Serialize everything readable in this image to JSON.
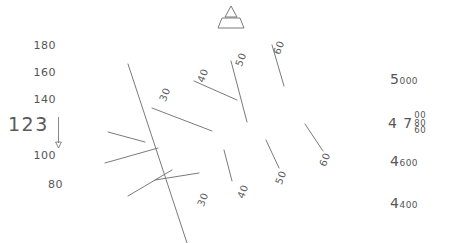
{
  "display": {
    "name": "primary-flight-display",
    "background_color": "#ffffff",
    "line_color": "#6b6b6b",
    "text_color": "#565656"
  },
  "airspeed": {
    "label": "airspeed-tape",
    "current_value": "123",
    "units": "kt",
    "trend_direction": "down",
    "ticks": [
      {
        "value": "180",
        "x": 26,
        "y": 39
      },
      {
        "value": "160",
        "x": 26,
        "y": 66
      },
      {
        "value": "140",
        "x": 26,
        "y": 93
      },
      {
        "value": "100",
        "x": 26,
        "y": 149
      },
      {
        "value": "80",
        "x": 33,
        "y": 178
      }
    ]
  },
  "altitude": {
    "label": "altitude-tape",
    "units": "ft",
    "readout_lead": "4 7",
    "readout_roller": [
      "00",
      "80",
      "60"
    ],
    "ticks": [
      {
        "big": "5",
        "small": "000",
        "y": 69
      },
      {
        "big": "4",
        "small": "600",
        "y": 151
      },
      {
        "big": "4",
        "small": "400",
        "y": 193
      }
    ]
  },
  "attitude": {
    "label": "attitude-indicator",
    "roll_degrees": -62,
    "bank_pointer": "sky-pointer-triangle",
    "horizon_line": {
      "x1": 128,
      "y1": 64,
      "x2": 187,
      "y2": 243
    },
    "pitch_lines": [
      {
        "deg": "30",
        "side": "up",
        "x1": 152,
        "y1": 108,
        "x2": 212,
        "y2": 131,
        "lx": 158,
        "ly": 89,
        "rot": -68
      },
      {
        "deg": "40",
        "side": "up",
        "x1": 194,
        "y1": 81,
        "x2": 237,
        "y2": 100,
        "lx": 196,
        "ly": 70,
        "rot": -68
      },
      {
        "deg": "50",
        "side": "up",
        "x1": 231,
        "y1": 61,
        "x2": 247,
        "y2": 122,
        "lx": 234,
        "ly": 54,
        "rot": -68
      },
      {
        "deg": "60",
        "side": "up",
        "x1": 272,
        "y1": 45,
        "x2": 284,
        "y2": 86,
        "lx": 272,
        "ly": 42,
        "rot": -68
      },
      {
        "deg": "30",
        "side": "down",
        "x1": 155,
        "y1": 180,
        "x2": 199,
        "y2": 173,
        "lx": 196,
        "ly": 194,
        "rot": -68
      },
      {
        "deg": "40",
        "side": "down",
        "x1": 224,
        "y1": 150,
        "x2": 232,
        "y2": 181,
        "lx": 236,
        "ly": 186,
        "rot": -68
      },
      {
        "deg": "50",
        "side": "down",
        "x1": 266,
        "y1": 140,
        "x2": 279,
        "y2": 168,
        "lx": 274,
        "ly": 172,
        "rot": -68
      },
      {
        "deg": "60",
        "side": "down",
        "x1": 305,
        "y1": 124,
        "x2": 323,
        "y2": 151,
        "lx": 318,
        "ly": 154,
        "rot": -68
      }
    ],
    "minor_ticks": [
      {
        "x1": 108,
        "y1": 132,
        "x2": 145,
        "y2": 142
      },
      {
        "x1": 105,
        "y1": 163,
        "x2": 158,
        "y2": 148
      },
      {
        "x1": 128,
        "y1": 196,
        "x2": 172,
        "y2": 170
      }
    ]
  }
}
